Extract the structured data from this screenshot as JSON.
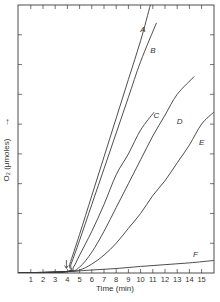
{
  "chart_data": {
    "type": "line",
    "title": "",
    "xlabel": "Time (min)",
    "ylabel": "O₂ (μmoles)",
    "ylabel_arrow": "→",
    "xlim": [
      0,
      16
    ],
    "ylim": [
      0,
      9
    ],
    "x_ticks": [
      1,
      2,
      3,
      4,
      5,
      6,
      7,
      8,
      9,
      10,
      11,
      12,
      13,
      14,
      15
    ],
    "x_tick_labels": [
      "1",
      "2",
      "3",
      "4",
      "5",
      "6",
      "7",
      "8",
      "9",
      "10",
      "11",
      "12",
      "13",
      "14",
      "15"
    ],
    "y_ticks": [
      1,
      2,
      3,
      4,
      5,
      6,
      7,
      8
    ],
    "y_tick_labels": [],
    "grid": false,
    "legend": "inline curve labels",
    "annotations": [
      {
        "type": "arrow",
        "x": 4,
        "label": "addition point (down arrow)"
      }
    ],
    "series": [
      {
        "name": "A",
        "label_pos": [
          10.2,
          8.1
        ],
        "points": [
          [
            0,
            0
          ],
          [
            4,
            0.05
          ],
          [
            4.2,
            0.3
          ],
          [
            5,
            1.3
          ],
          [
            6,
            2.6
          ],
          [
            7,
            3.9
          ],
          [
            8,
            5.2
          ],
          [
            9,
            6.5
          ],
          [
            10,
            7.8
          ],
          [
            10.8,
            9.0
          ]
        ]
      },
      {
        "name": "B",
        "label_pos": [
          11.0,
          7.4
        ],
        "points": [
          [
            0,
            0
          ],
          [
            4,
            0.05
          ],
          [
            4.3,
            0.3
          ],
          [
            5,
            1.1
          ],
          [
            6,
            2.3
          ],
          [
            7,
            3.5
          ],
          [
            8,
            4.7
          ],
          [
            9,
            5.9
          ],
          [
            10,
            7.1
          ],
          [
            11.3,
            8.4
          ]
        ]
      },
      {
        "name": "C",
        "label_pos": [
          11.3,
          5.2
        ],
        "points": [
          [
            0,
            0
          ],
          [
            4,
            0.05
          ],
          [
            4.5,
            0.2
          ],
          [
            5,
            0.6
          ],
          [
            6,
            1.4
          ],
          [
            7,
            2.3
          ],
          [
            8,
            3.3
          ],
          [
            9,
            4.0
          ],
          [
            10,
            4.8
          ],
          [
            11.1,
            5.4
          ]
        ]
      },
      {
        "name": "D",
        "label_pos": [
          13.2,
          5.0
        ],
        "points": [
          [
            0,
            0
          ],
          [
            4,
            0.05
          ],
          [
            5,
            0.2
          ],
          [
            6,
            0.7
          ],
          [
            7,
            1.4
          ],
          [
            8,
            2.2
          ],
          [
            9,
            3.0
          ],
          [
            10,
            3.8
          ],
          [
            11,
            4.6
          ],
          [
            12,
            5.3
          ],
          [
            13,
            6.0
          ],
          [
            14.4,
            6.6
          ]
        ]
      },
      {
        "name": "E",
        "label_pos": [
          15.0,
          4.3
        ],
        "points": [
          [
            0,
            0
          ],
          [
            4,
            0.05
          ],
          [
            5,
            0.1
          ],
          [
            6,
            0.3
          ],
          [
            7,
            0.6
          ],
          [
            8,
            1.0
          ],
          [
            9,
            1.5
          ],
          [
            10,
            2.0
          ],
          [
            11,
            2.6
          ],
          [
            12,
            3.1
          ],
          [
            13,
            3.7
          ],
          [
            14,
            4.3
          ],
          [
            15,
            5.0
          ],
          [
            16,
            5.4
          ]
        ]
      },
      {
        "name": "F",
        "label_pos": [
          14.5,
          0.55
        ],
        "points": [
          [
            0,
            0
          ],
          [
            4,
            0.05
          ],
          [
            6,
            0.1
          ],
          [
            8,
            0.15
          ],
          [
            10,
            0.22
          ],
          [
            12,
            0.28
          ],
          [
            14,
            0.34
          ],
          [
            16,
            0.42
          ]
        ]
      }
    ]
  }
}
